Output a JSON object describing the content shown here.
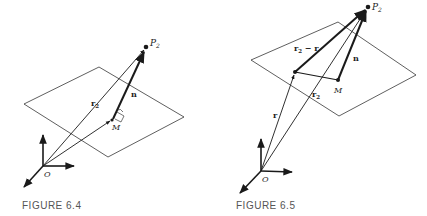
{
  "figures": [
    {
      "id": "6.4",
      "caption": "FIGURE 6.4",
      "labels": {
        "point_p": "P",
        "point_p_sub": "2",
        "vector_r2": "r",
        "vector_r2_sub": "2",
        "vector_n": "n",
        "point_m": "M",
        "origin": "O"
      }
    },
    {
      "id": "6.5",
      "caption": "FIGURE 6.5",
      "labels": {
        "point_p": "P",
        "point_p_sub": "2",
        "vector_r2_minus_r": "r",
        "vector_r2_minus_r_sub": "2",
        "vector_r2_minus_r_rest": " − r",
        "vector_n": "n",
        "point_m": "M",
        "vector_r2": "r",
        "vector_r2_sub": "2",
        "vector_r": "r",
        "origin": "O"
      }
    }
  ],
  "colors": {
    "ink": "#1a1a1a",
    "caption": "#555555",
    "background": "#ffffff"
  }
}
